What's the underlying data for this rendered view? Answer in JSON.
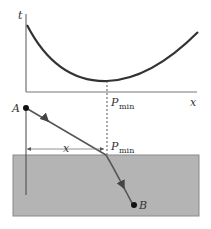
{
  "graph": {
    "y_axis_label": "t",
    "x_axis_label": "x",
    "min_label_main": "P",
    "min_label_sub": "min",
    "curve": "t(x) decreasing from upper left to minimum at P_min, then increasing to right"
  },
  "geometry": {
    "point_a_label": "A",
    "point_b_label": "B",
    "distance_label": "x",
    "interface_point_main": "P",
    "interface_point_sub": "min"
  },
  "colors": {
    "line": "#333333",
    "ray": "#555555",
    "medium_fill": "#b4b4b4",
    "medium_border": "#8a8a8a",
    "background": "#ffffff"
  }
}
